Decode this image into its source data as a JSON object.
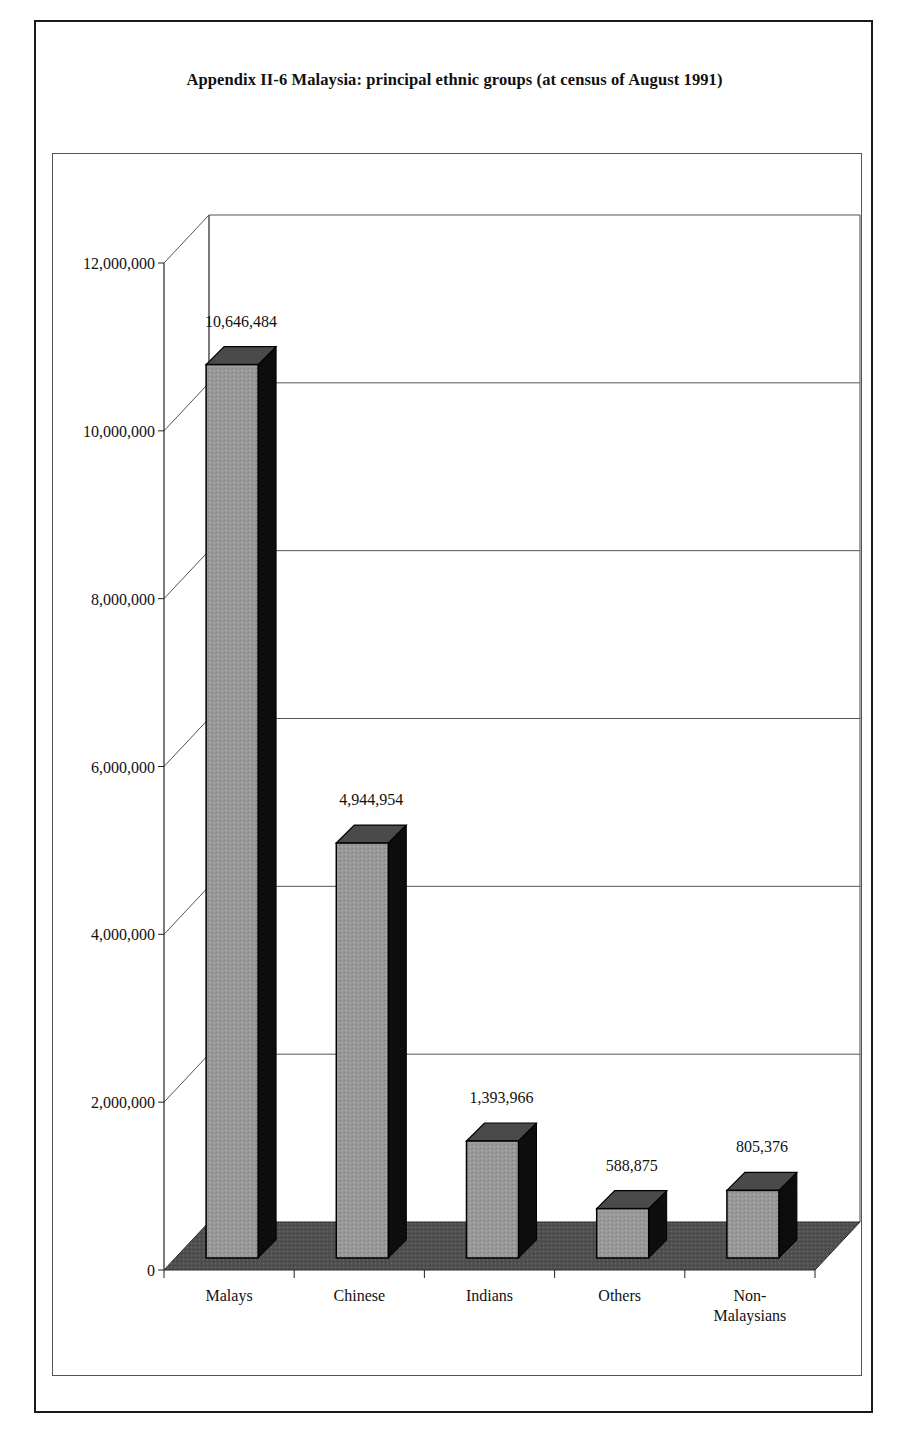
{
  "title": "Appendix II-6 Malaysia: principal ethnic groups (at census of August 1991)",
  "chart_data": {
    "type": "bar",
    "style": "3d-column",
    "title": "Appendix II-6 Malaysia: principal ethnic groups (at census of August 1991)",
    "xlabel": "",
    "ylabel": "",
    "categories": [
      "Malays",
      "Chinese",
      "Indians",
      "Others",
      "Non-Malaysians"
    ],
    "category_lines": [
      [
        "Malays"
      ],
      [
        "Chinese"
      ],
      [
        "Indians"
      ],
      [
        "Others"
      ],
      [
        "Non-",
        "Malaysians"
      ]
    ],
    "values": [
      10646484,
      4944954,
      1393966,
      588875,
      805376
    ],
    "value_labels": [
      "10,646,484",
      "4,944,954",
      "1,393,966",
      "588,875",
      "805,376"
    ],
    "ylim": [
      0,
      12000000
    ],
    "yticks": [
      0,
      2000000,
      4000000,
      6000000,
      8000000,
      10000000,
      12000000
    ],
    "ytick_labels": [
      "0",
      "2,000,000",
      "4,000,000",
      "6,000,000",
      "8,000,000",
      "10,000,000",
      "12,000,000"
    ],
    "grid": true,
    "legend": null,
    "colors": {
      "bar_front": "#9a9a9a",
      "bar_top": "#4a4a4a",
      "bar_side": "#0d0d0d",
      "floor": "#4f4f4f",
      "gridline": "#555555"
    }
  }
}
